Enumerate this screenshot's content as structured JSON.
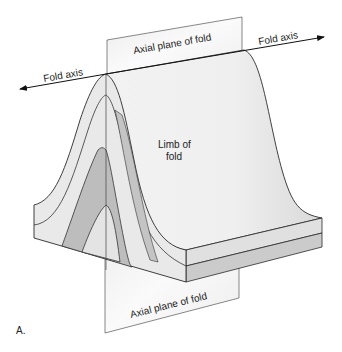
{
  "diagram": {
    "labels": {
      "fold_axis_left": "Fold axis",
      "fold_axis_right": "Fold axis",
      "axial_plane_top": "Axial plane of fold",
      "axial_plane_bottom": "Axial plane of fold",
      "limb_line1": "Limb of",
      "limb_line2": "fold",
      "figure_letter": "A."
    },
    "colors": {
      "outline": "#2a2a2a",
      "light_layer": "#e6e6e6",
      "dark_layer": "#b9b9b9",
      "plane": "#f4f4f4",
      "surface": "#ececec"
    }
  }
}
